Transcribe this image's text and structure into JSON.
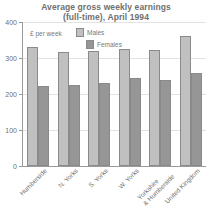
{
  "chart_data": {
    "type": "bar",
    "title": "Average gross weekly earnings (full-time), April 1994",
    "title_line1": "Average gross weekly earnings",
    "title_line2": "(full-time), April 1994",
    "xlabel": "",
    "ylabel": "£ per week",
    "ylim": [
      0,
      400
    ],
    "yticks": [
      0,
      100,
      200,
      300,
      400
    ],
    "ytick_labels": [
      "0",
      "100",
      "200",
      "300",
      "400"
    ],
    "grid": true,
    "legend_position": "inside-top-left",
    "categories": [
      "Humberside",
      "N. Yorks",
      "S. Yorks",
      "W. Yorks",
      "Yorkshire & Humberside",
      "United Kingdom"
    ],
    "category_lines": [
      [
        "Humberside"
      ],
      [
        "N. Yorks"
      ],
      [
        "S. Yorks"
      ],
      [
        "W. Yorks"
      ],
      [
        "Yorkshire",
        "& Humberside"
      ],
      [
        "United Kingdom"
      ]
    ],
    "series": [
      {
        "name": "Males",
        "color": "#c0c0c0",
        "values": [
          330,
          318,
          320,
          325,
          322,
          360
        ]
      },
      {
        "name": "Females",
        "color": "#969696",
        "values": [
          222,
          225,
          230,
          245,
          238,
          258
        ]
      }
    ]
  },
  "colors": {
    "males": "#c0c0c0",
    "females": "#969696",
    "axis": "#9a9a9a",
    "grid": "#e2e2e2",
    "text": "#6f6f6f",
    "background": "#ffffff"
  }
}
